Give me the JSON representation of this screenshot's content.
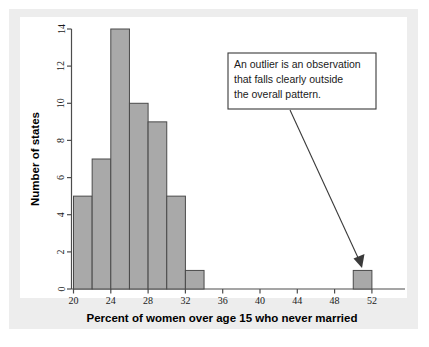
{
  "figure": {
    "background_color": "#ededed",
    "panel_color": "#ffffff"
  },
  "chart_data": {
    "type": "bar",
    "title": "",
    "subtitle": "",
    "xlabel": "Percent of women over age 15 who never married",
    "ylabel": "Number of states",
    "xlim": [
      18,
      54
    ],
    "ylim": [
      0,
      15
    ],
    "xticks": [
      20,
      24,
      28,
      32,
      36,
      40,
      44,
      48,
      52
    ],
    "yticks": [
      0,
      2,
      4,
      6,
      8,
      10,
      12,
      14
    ],
    "xtick_labels": [
      "20",
      "24",
      "28",
      "32",
      "36",
      "40",
      "44",
      "48",
      "52"
    ],
    "ytick_labels": [
      "0",
      "2",
      "4",
      "6",
      "8",
      "10",
      "12",
      "14"
    ],
    "grid": false,
    "legend": null,
    "bin_width": 2,
    "bar_color": "#a9a9a9",
    "bar_edge_color": "#4a4a4a",
    "categories": [
      "20-22",
      "22-24",
      "24-26",
      "26-28",
      "28-30",
      "30-32",
      "32-34",
      "50-52"
    ],
    "bins": [
      {
        "start": 20,
        "end": 22,
        "count": 5
      },
      {
        "start": 22,
        "end": 24,
        "count": 7
      },
      {
        "start": 24,
        "end": 26,
        "count": 14
      },
      {
        "start": 26,
        "end": 28,
        "count": 10
      },
      {
        "start": 28,
        "end": 30,
        "count": 9
      },
      {
        "start": 30,
        "end": 32,
        "count": 5
      },
      {
        "start": 32,
        "end": 34,
        "count": 1
      },
      {
        "start": 50,
        "end": 52,
        "count": 1
      }
    ],
    "values": [
      5,
      7,
      14,
      10,
      9,
      5,
      1,
      1
    ],
    "annotations": [
      {
        "id": "outlier-callout",
        "lines": [
          "An outlier is an observation",
          "that falls clearly outside",
          "the overall pattern."
        ],
        "text": "An outlier is an observation that falls clearly outside the overall pattern.",
        "points_to_bin": "50-52"
      }
    ]
  },
  "axis": {
    "x_title": "Percent of women over age 15 who never married",
    "y_title": "Number of states"
  },
  "annotation": {
    "line1": "An outlier is an observation",
    "line2": "that falls clearly outside",
    "line3": "the overall pattern."
  },
  "ticks": {
    "x": [
      "20",
      "24",
      "28",
      "32",
      "36",
      "40",
      "44",
      "48",
      "52"
    ],
    "y": [
      "0",
      "2",
      "4",
      "6",
      "8",
      "10",
      "12",
      "14"
    ]
  }
}
